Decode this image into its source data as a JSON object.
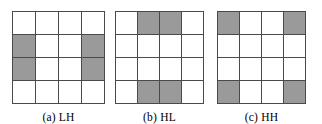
{
  "figure": {
    "type": "subband-grid-diagram",
    "grid_size": 4,
    "colors": {
      "shaded_cell": "#9a9a9a",
      "empty_cell": "#ffffff",
      "grid_line": "#4a4a4a",
      "caption_text": "#000000",
      "background": "#ffffff"
    },
    "panels": [
      {
        "id": "a",
        "label": "(a) LH",
        "name": "LH",
        "cells": [
          [
            0,
            0,
            0,
            0
          ],
          [
            1,
            0,
            0,
            1
          ],
          [
            1,
            0,
            0,
            1
          ],
          [
            0,
            0,
            0,
            0
          ]
        ]
      },
      {
        "id": "b",
        "label": "(b) HL",
        "name": "HL",
        "cells": [
          [
            0,
            1,
            1,
            0
          ],
          [
            0,
            0,
            0,
            0
          ],
          [
            0,
            0,
            0,
            0
          ],
          [
            0,
            1,
            1,
            0
          ]
        ]
      },
      {
        "id": "c",
        "label": "(c) HH",
        "name": "HH",
        "cells": [
          [
            1,
            0,
            0,
            1
          ],
          [
            0,
            0,
            0,
            0
          ],
          [
            0,
            0,
            0,
            0
          ],
          [
            1,
            0,
            0,
            1
          ]
        ]
      }
    ]
  }
}
